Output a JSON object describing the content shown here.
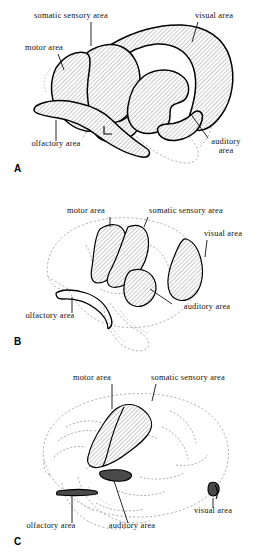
{
  "figure": {
    "panels": [
      {
        "letter": "A",
        "labels": {
          "somatic_sensory": "somatic sensory area",
          "visual": "visual area",
          "motor": "motor area",
          "olfactory": "olfactory area",
          "auditory_line1": "auditory",
          "auditory_line2": "area"
        }
      },
      {
        "letter": "B",
        "labels": {
          "motor": "motor area",
          "somatic_sensory": "somatic sensory area",
          "visual": "visual area",
          "olfactory": "olfactory area",
          "auditory": "auditory area"
        }
      },
      {
        "letter": "C",
        "labels": {
          "motor": "motor area",
          "somatic_sensory": "somatic sensory area",
          "visual": "visual area",
          "olfactory": "olfactory area",
          "auditory": "auditory area"
        }
      }
    ]
  },
  "colors": {
    "ink": "#111111",
    "hatch": "#8a8a8a",
    "faint_outline": "#9a9a9a",
    "dark_fill": "#4a4a4a",
    "background": "#ffffff"
  }
}
